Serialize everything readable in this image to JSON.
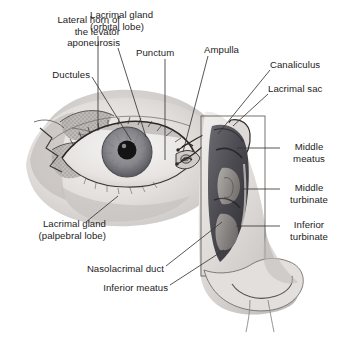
{
  "figure": {
    "background_color": "#ffffff",
    "ink_color": "#1c1c1c",
    "width": 338,
    "height": 340
  },
  "labels": [
    {
      "id": "lateral-horn",
      "text": "Lateral horn of\nthe levator\naponeurosis",
      "align": "right",
      "x": 12,
      "y": 14,
      "w": 108,
      "leader": [
        [
          118,
          48
        ],
        [
          146,
          137
        ]
      ]
    },
    {
      "id": "ductules",
      "text": "Ductules",
      "align": "right",
      "x": 12,
      "y": 69,
      "w": 78,
      "leader": [
        [
          92,
          77
        ],
        [
          131,
          140
        ]
      ]
    },
    {
      "id": "lacrimal-gland-orbital",
      "text": "Lacrimal gland\n(orbital lobe)",
      "align": "left",
      "x": 90,
      "y": 9,
      "w": 92,
      "leader": [
        [
          98,
          36
        ],
        [
          98,
          131
        ]
      ]
    },
    {
      "id": "punctum",
      "text": "Punctum",
      "align": "left",
      "x": 136,
      "y": 47,
      "w": 62,
      "leader": [
        [
          165,
          59
        ],
        [
          165,
          160
        ]
      ]
    },
    {
      "id": "ampulla",
      "text": "Ampulla",
      "align": "left",
      "x": 204,
      "y": 44,
      "w": 56,
      "leader": [
        [
          208,
          56
        ],
        [
          183,
          152
        ]
      ]
    },
    {
      "id": "canaliculus",
      "text": "Canaliculus",
      "align": "left",
      "x": 270,
      "y": 59,
      "w": 68,
      "leader": [
        [
          270,
          70
        ],
        [
          218,
          134
        ]
      ]
    },
    {
      "id": "lacrimal-sac",
      "text": "Lacrimal sac",
      "align": "left",
      "x": 268,
      "y": 83,
      "w": 70,
      "leader": [
        [
          268,
          94
        ],
        [
          233,
          126
        ]
      ]
    },
    {
      "id": "middle-meatus",
      "text": "Middle\nmeatus",
      "align": "left",
      "x": 283,
      "y": 141,
      "w": 52,
      "leader": [
        [
          280,
          148
        ],
        [
          237,
          148
        ]
      ]
    },
    {
      "id": "middle-turbinate",
      "text": "Middle\nturbinate",
      "align": "left",
      "x": 283,
      "y": 182,
      "w": 52,
      "leader": [
        [
          280,
          189
        ],
        [
          241,
          189
        ]
      ]
    },
    {
      "id": "inferior-turbinate",
      "text": "Inferior\nturbinate",
      "align": "left",
      "x": 283,
      "y": 219,
      "w": 52,
      "leader": [
        [
          280,
          226
        ],
        [
          236,
          226
        ]
      ]
    },
    {
      "id": "lacrimal-gland-palpebral",
      "text": "Lacrimal gland\n(palpebral lobe)",
      "align": "right",
      "x": 8,
      "y": 218,
      "w": 98,
      "leader": [
        [
          86,
          222
        ],
        [
          118,
          196
        ]
      ]
    },
    {
      "id": "nasolacrimal-duct",
      "text": "Nasolacrimal duct",
      "align": "right",
      "x": 58,
      "y": 263,
      "w": 106,
      "leader": [
        [
          166,
          266
        ],
        [
          222,
          222
        ]
      ]
    },
    {
      "id": "inferior-meatus",
      "text": "Inferior meatus",
      "align": "right",
      "x": 82,
      "y": 282,
      "w": 86,
      "leader": [
        [
          170,
          285
        ],
        [
          224,
          250
        ]
      ]
    }
  ],
  "artwork": {
    "eye": {
      "name": "anterior eye with eyelids and lacrimal gland",
      "iris_color": "#8b8b8e",
      "pupil_color": "#151515",
      "sclera_color": "#eceaea",
      "skin_color": "#dedbd8"
    },
    "nose": {
      "name": "nasal cavity cutaway with turbinates and meatuses",
      "cavity_color": "#55555a",
      "tissue_color": "#cfcdcb"
    }
  }
}
